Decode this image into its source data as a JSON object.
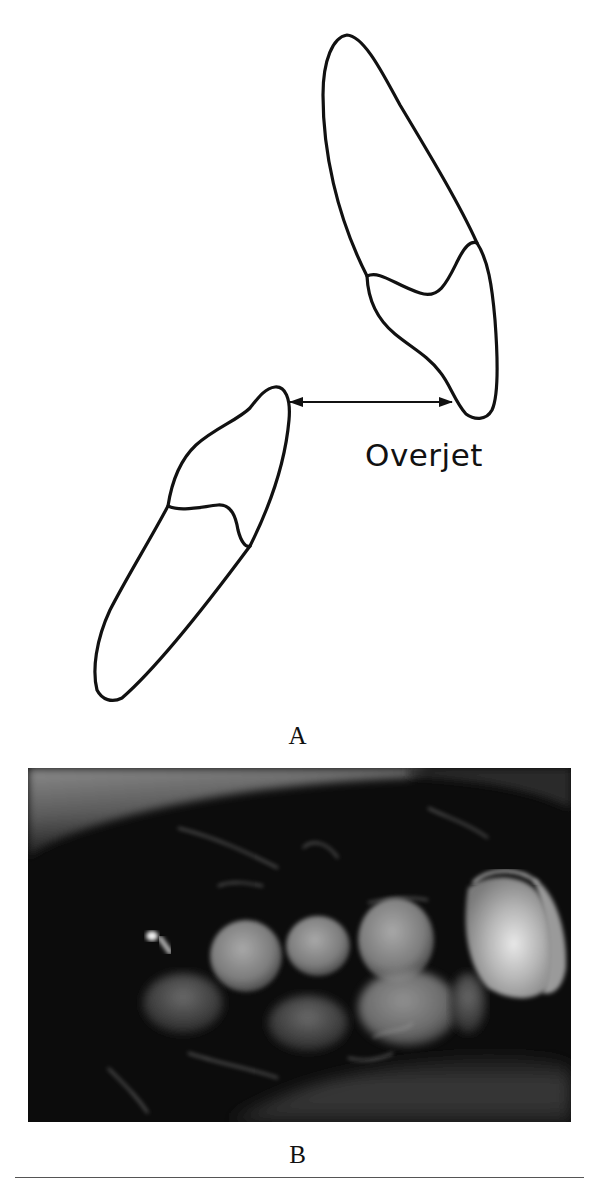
{
  "figure": {
    "panel_a": {
      "label": "A",
      "annotation": "Overjet",
      "elements": [
        "upper-incisor-outline",
        "lower-incisor-outline",
        "double-headed-arrow"
      ]
    },
    "panel_b": {
      "label": "B",
      "description": "intraoral photograph of teeth in occlusion"
    },
    "colors": {
      "line": "#111111",
      "background": "#ffffff",
      "rule": "#555555"
    }
  }
}
